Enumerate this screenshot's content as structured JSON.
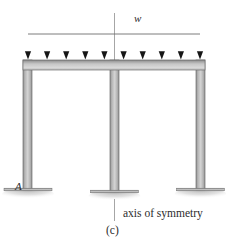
{
  "figure": {
    "caption": "(c)",
    "axis_label": "axis of symmetry",
    "load_label": "w",
    "support_label": "A"
  },
  "geometry": {
    "beam": {
      "x1": 23,
      "x2": 205,
      "y_top": 60,
      "thickness": 10
    },
    "columns": [
      {
        "name": "left-column",
        "x": 23,
        "width": 9,
        "y_top": 60,
        "y_bottom": 190
      },
      {
        "name": "middle-column",
        "x": 110,
        "width": 9,
        "y_top": 60,
        "y_bottom": 192
      },
      {
        "name": "right-column",
        "x": 196,
        "width": 9,
        "y_top": 60,
        "y_bottom": 190
      }
    ],
    "supports": [
      {
        "name": "support-A",
        "cx": 27.5,
        "cy": 190,
        "plate_width": 48
      },
      {
        "name": "support-middle",
        "cx": 114.5,
        "cy": 192,
        "plate_width": 48
      },
      {
        "name": "support-right",
        "cx": 200.5,
        "cy": 190,
        "plate_width": 48
      }
    ],
    "load": {
      "line_y": 34,
      "line_x1": 28,
      "line_x2": 200,
      "arrow_tip_y": 59,
      "arrow_count": 10,
      "arrow_x": [
        28,
        47.1,
        66.2,
        85.3,
        104.4,
        123.6,
        142.7,
        161.8,
        180.9,
        200
      ]
    },
    "symmetry_axis": {
      "x": 114.5,
      "segments": [
        {
          "y1": 13,
          "y2": 60
        },
        {
          "y1": 198,
          "y2": 222
        }
      ]
    }
  },
  "colors": {
    "frame_light": "#d5d5d5",
    "frame_mid": "#a9a9a9",
    "frame_dark": "#8a8a8a",
    "frame_edge": "#6e6e6e",
    "arrow": "#1c1c1c",
    "arrow_shadow": "#9a9a9a",
    "ground": "#c9c9c9",
    "axis_line": "#9b9b9b",
    "text": "#2b2b2b",
    "background": "#ffffff"
  }
}
